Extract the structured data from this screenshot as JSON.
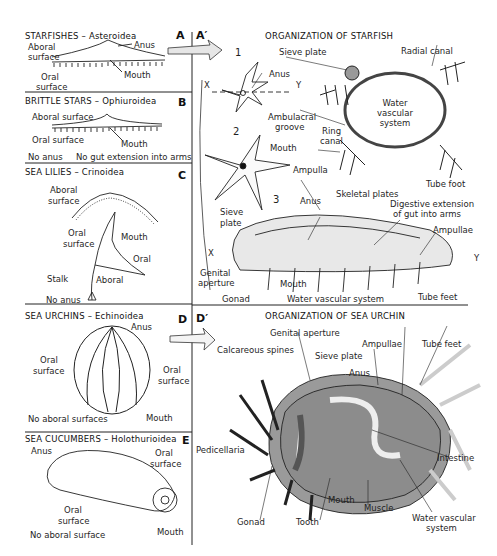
{
  "left_panels": [
    {
      "letter": "A",
      "title": "STARFISHES",
      "taxon": "Asteroidea",
      "labels": [
        "Aboral",
        "surface",
        "Anus",
        "Oral",
        "surface",
        "Mouth"
      ]
    },
    {
      "letter": "B",
      "title": "BRITTLE STARS",
      "taxon": "Ophiuroidea",
      "labels": [
        "Aboral surface",
        "Oral surface",
        "Mouth"
      ],
      "notes": [
        "No anus",
        "No gut extension into arms"
      ]
    },
    {
      "letter": "C",
      "title": "SEA LILIES",
      "taxon": "Crinoidea",
      "labels": [
        "Aboral",
        "surface",
        "Oral",
        "surface",
        "Mouth",
        "Oral",
        "Stalk",
        "Aboral"
      ],
      "notes": [
        "No anus"
      ]
    },
    {
      "letter": "D",
      "title": "SEA URCHINS",
      "taxon": "Echinoidea",
      "labels": [
        "Anus",
        "Oral",
        "surface",
        "Oral",
        "surface",
        "Mouth"
      ],
      "notes": [
        "No aboral surfaces"
      ]
    },
    {
      "letter": "E",
      "title": "SEA CUCUMBERS",
      "taxon": "Holothurioidea",
      "labels": [
        "Anus",
        "Oral",
        "surface",
        "Oral",
        "surface",
        "Mouth"
      ],
      "notes": [
        "No aboral surface"
      ]
    }
  ],
  "starfish_panel": {
    "letter": "A′",
    "title": "ORGANIZATION OF STARFISH",
    "figure_numbers": [
      "1",
      "2",
      "3"
    ],
    "axis": {
      "x": "X",
      "y": "Y"
    },
    "labels": {
      "sieve_plate_1": "Sieve plate",
      "anus_1": "Anus",
      "radial_canal": "Radial canal",
      "water_vascular": [
        "Water",
        "vascular",
        "system"
      ],
      "ring_canal": [
        "Ring",
        "canal"
      ],
      "ambulacral_groove": [
        "Ambulacral",
        "groove"
      ],
      "mouth_2": "Mouth",
      "ampulla": "Ampulla",
      "tube_foot": "Tube foot",
      "anus_3": "Anus",
      "skeletal_plates": "Skeletal plates",
      "sieve_plate_3": [
        "Sieve",
        "plate"
      ],
      "digestive_extension": [
        "Digestive extension",
        "of gut into arms"
      ],
      "ampullae": "Ampullae",
      "genital_aperture": [
        "Genital",
        "aperture"
      ],
      "mouth_3": "Mouth",
      "gonad": "Gonad",
      "water_vascular_3": "Water vascular system",
      "tube_feet": "Tube feet"
    }
  },
  "urchin_panel": {
    "letter": "D′",
    "title": "ORGANIZATION OF SEA URCHIN",
    "labels": {
      "genital_aperture": "Genital aperture",
      "calcareous_spines": "Calcareous spines",
      "sieve_plate": "Sieve plate",
      "anus": "Anus",
      "ampullae": "Ampullae",
      "tube_feet": "Tube feet",
      "pedicellaria": "Pedicellaria",
      "intestine": "Intestine",
      "gonad": "Gonad",
      "tooth": "Tooth",
      "mouth": "Mouth",
      "muscle": "Muscle",
      "water_vascular": [
        "Water vascular",
        "system"
      ]
    }
  }
}
